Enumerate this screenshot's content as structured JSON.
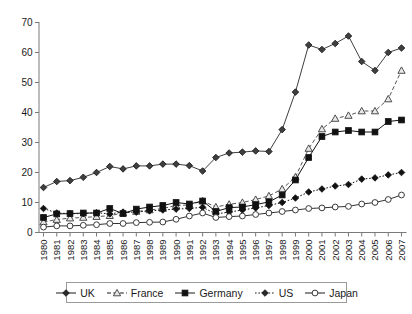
{
  "chart_data": {
    "type": "line",
    "title": "",
    "subtitle": "",
    "xlabel": "",
    "ylabel": "",
    "ylim": [
      0,
      70
    ],
    "yticks": [
      0,
      10,
      20,
      30,
      40,
      50,
      60,
      70
    ],
    "grid": false,
    "legend_position": "bottom",
    "categories": [
      "1980",
      "1981",
      "1982",
      "1983",
      "1984",
      "1985",
      "1986",
      "1987",
      "1998",
      "1989",
      "1990",
      "1991",
      "1992",
      "1993",
      "1994",
      "1995",
      "1996",
      "1997",
      "1998",
      "1999",
      "2000",
      "2001",
      "2002",
      "2003",
      "2004",
      "2005",
      "2006",
      "2007"
    ],
    "x": [
      "1980",
      "1981",
      "1982",
      "1983",
      "1984",
      "1985",
      "1986",
      "1987",
      "1998",
      "1989",
      "1990",
      "1991",
      "1992",
      "1993",
      "1994",
      "1995",
      "1996",
      "1997",
      "1998",
      "1999",
      "2000",
      "2001",
      "2002",
      "2003",
      "2004",
      "2005",
      "2006",
      "2007"
    ],
    "series": [
      {
        "name": "UK",
        "marker": "filled-diamond",
        "line_style": "solid",
        "color": "#3f3f3f",
        "values": [
          15.0,
          17.0,
          17.3,
          18.4,
          20.0,
          22.0,
          21.2,
          22.2,
          22.2,
          22.8,
          22.8,
          22.3,
          20.5,
          25.0,
          26.5,
          26.8,
          27.2,
          27.0,
          34.3,
          46.8,
          62.5,
          61.0,
          63.0,
          65.5,
          57.0,
          54.0,
          60.0,
          61.5
        ]
      },
      {
        "name": "France",
        "marker": "open-triangle",
        "line_style": "dashed",
        "color": "#555555",
        "values": [
          3.5,
          4.3,
          4.8,
          5.0,
          5.3,
          5.6,
          6.5,
          7.0,
          7.5,
          8.0,
          9.0,
          9.2,
          10.5,
          8.5,
          9.4,
          10.0,
          11.0,
          12.2,
          14.5,
          18.5,
          28.0,
          34.5,
          38.0,
          39.0,
          40.5,
          40.5,
          44.5,
          54.0
        ]
      },
      {
        "name": "Germany",
        "marker": "filled-square",
        "line_style": "solid",
        "color": "#111111",
        "values": [
          5.0,
          6.2,
          6.3,
          6.5,
          6.5,
          8.0,
          6.3,
          7.8,
          8.5,
          9.0,
          10.0,
          9.5,
          10.5,
          7.0,
          8.3,
          8.5,
          9.3,
          10.2,
          12.5,
          17.5,
          25.0,
          32.0,
          33.5,
          34.0,
          33.5,
          33.5,
          37.0,
          37.5
        ]
      },
      {
        "name": "US",
        "marker": "filled-diamond",
        "line_style": "dotted",
        "color": "#111111",
        "values": [
          8.0,
          6.5,
          6.3,
          6.3,
          6.6,
          6.2,
          6.8,
          6.8,
          7.2,
          7.5,
          7.8,
          8.0,
          8.4,
          6.2,
          6.8,
          7.5,
          8.2,
          9.0,
          10.0,
          11.5,
          13.5,
          14.5,
          15.5,
          16.0,
          17.8,
          18.2,
          19.2,
          20.0
        ]
      },
      {
        "name": "Japan",
        "marker": "open-circle",
        "line_style": "solid",
        "color": "#333333",
        "values": [
          1.8,
          2.2,
          2.2,
          2.4,
          2.6,
          3.0,
          3.0,
          3.3,
          3.4,
          3.5,
          4.4,
          5.5,
          6.5,
          5.0,
          5.3,
          5.5,
          6.0,
          6.5,
          7.0,
          7.5,
          8.0,
          8.2,
          8.5,
          8.7,
          9.5,
          10.0,
          11.0,
          12.5
        ]
      }
    ]
  },
  "legend": {
    "items": [
      {
        "label": "UK",
        "marker": "filled-diamond",
        "line_style": "solid"
      },
      {
        "label": "France",
        "marker": "open-triangle",
        "line_style": "dashed"
      },
      {
        "label": "Germany",
        "marker": "filled-square",
        "line_style": "solid"
      },
      {
        "label": "US",
        "marker": "filled-diamond",
        "line_style": "dotted"
      },
      {
        "label": "Japan",
        "marker": "open-circle",
        "line_style": "solid"
      }
    ]
  }
}
